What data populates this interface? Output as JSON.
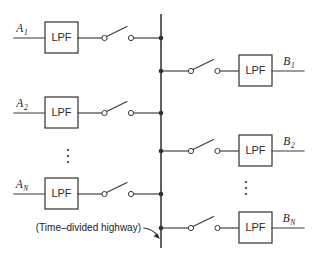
{
  "diagram": {
    "caption": {
      "text": "(Time–divided highway)",
      "points_to": "vertical-bus"
    },
    "colors": {
      "line": "#3a3a3a",
      "bus": "#3a3a3a",
      "node": "#2e2e2e",
      "text": "#1c1c1c",
      "background": "#ffffff",
      "contact_fill": "#ffffff"
    },
    "filter_label": "LPF",
    "bus": {
      "label": "time-divided highway",
      "x": 161,
      "y_top": 14,
      "y_bottom": 248
    },
    "ellipsis_glyph": "⋮",
    "inputs": [
      {
        "id": "A1",
        "base": "A",
        "subscript": "1",
        "label": "A₁",
        "y": 38,
        "filter_label": "LPF",
        "switch_state": "open"
      },
      {
        "id": "A2",
        "base": "A",
        "subscript": "2",
        "label": "A₂",
        "y": 113,
        "filter_label": "LPF",
        "switch_state": "open"
      },
      {
        "id": "AN",
        "base": "A",
        "subscript": "N",
        "label": "A_N",
        "y": 194,
        "filter_label": "LPF",
        "switch_state": "open"
      }
    ],
    "outputs": [
      {
        "id": "B1",
        "base": "B",
        "subscript": "1",
        "label": "B₁",
        "y": 71,
        "filter_label": "LPF",
        "switch_state": "open"
      },
      {
        "id": "B2",
        "base": "B",
        "subscript": "2",
        "label": "B₂",
        "y": 151,
        "filter_label": "LPF",
        "switch_state": "open"
      },
      {
        "id": "BN",
        "base": "B",
        "subscript": "N",
        "label": "B_N",
        "y": 228,
        "filter_label": "LPF",
        "switch_state": "open"
      }
    ],
    "input_ellipsis": {
      "x": 68,
      "y": 157
    },
    "output_ellipsis": {
      "x": 246,
      "y": 189
    }
  }
}
